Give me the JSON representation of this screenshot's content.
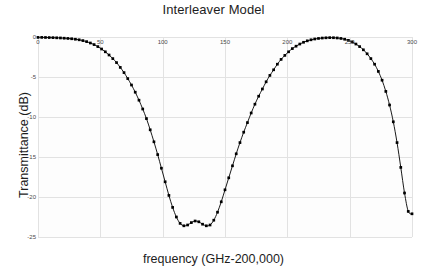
{
  "chart_data": {
    "type": "line",
    "title": "Interleaver Model",
    "xlabel": "frequency (GHz-200,000)",
    "ylabel": "Transmittance (dB)",
    "xlim": [
      0,
      300
    ],
    "ylim": [
      -25,
      0
    ],
    "xticks": [
      0,
      50,
      100,
      150,
      200,
      250,
      300
    ],
    "xticklabels": [
      "0",
      "50",
      "100",
      "150",
      "200",
      "250",
      "300"
    ],
    "yticks": [
      0,
      -5,
      -10,
      -15,
      -20,
      -25
    ],
    "yticklabels": [
      "0",
      "-5",
      "-10",
      "-15",
      "-20",
      "-25"
    ],
    "grid": true,
    "legend": null,
    "marker": "filled-square",
    "line_color": "#000000",
    "series": [
      {
        "name": "Transmittance",
        "x": [
          0,
          3,
          6,
          9,
          12,
          15,
          18,
          21,
          24,
          27,
          30,
          33,
          36,
          39,
          42,
          45,
          48,
          51,
          54,
          57,
          60,
          63,
          66,
          69,
          72,
          75,
          78,
          81,
          84,
          87,
          90,
          93,
          96,
          99,
          102,
          105,
          108,
          111,
          114,
          117,
          120,
          123,
          126,
          129,
          132,
          135,
          138,
          141,
          144,
          147,
          150,
          153,
          156,
          159,
          162,
          165,
          168,
          171,
          174,
          177,
          180,
          183,
          186,
          189,
          192,
          195,
          198,
          201,
          204,
          207,
          210,
          213,
          216,
          219,
          222,
          225,
          228,
          231,
          234,
          237,
          240,
          243,
          246,
          249,
          252,
          255,
          258,
          261,
          264,
          267,
          270,
          273,
          276,
          279,
          282,
          285,
          288,
          291,
          294,
          297,
          300
        ],
        "y": [
          -0.05,
          -0.05,
          -0.06,
          -0.07,
          -0.08,
          -0.1,
          -0.12,
          -0.15,
          -0.18,
          -0.22,
          -0.28,
          -0.35,
          -0.45,
          -0.58,
          -0.75,
          -0.95,
          -1.2,
          -1.5,
          -1.85,
          -2.25,
          -2.7,
          -3.2,
          -3.8,
          -4.45,
          -5.2,
          -6.0,
          -6.9,
          -7.9,
          -9.0,
          -10.2,
          -11.6,
          -13.1,
          -14.7,
          -16.4,
          -18.1,
          -19.8,
          -21.3,
          -22.5,
          -23.3,
          -23.6,
          -23.5,
          -23.2,
          -23.0,
          -23.1,
          -23.4,
          -23.6,
          -23.5,
          -22.9,
          -21.9,
          -20.6,
          -19.1,
          -17.6,
          -16.1,
          -14.6,
          -13.2,
          -11.9,
          -10.7,
          -9.5,
          -8.4,
          -7.4,
          -6.5,
          -5.6,
          -4.8,
          -4.1,
          -3.4,
          -2.8,
          -2.3,
          -1.85,
          -1.45,
          -1.15,
          -0.88,
          -0.66,
          -0.48,
          -0.35,
          -0.25,
          -0.18,
          -0.13,
          -0.1,
          -0.08,
          -0.09,
          -0.12,
          -0.18,
          -0.28,
          -0.42,
          -0.62,
          -0.88,
          -1.2,
          -1.6,
          -2.1,
          -2.7,
          -3.4,
          -4.3,
          -5.4,
          -6.8,
          -8.5,
          -10.6,
          -13.2,
          -16.3,
          -19.5,
          -21.8,
          -22.1
        ]
      }
    ]
  }
}
